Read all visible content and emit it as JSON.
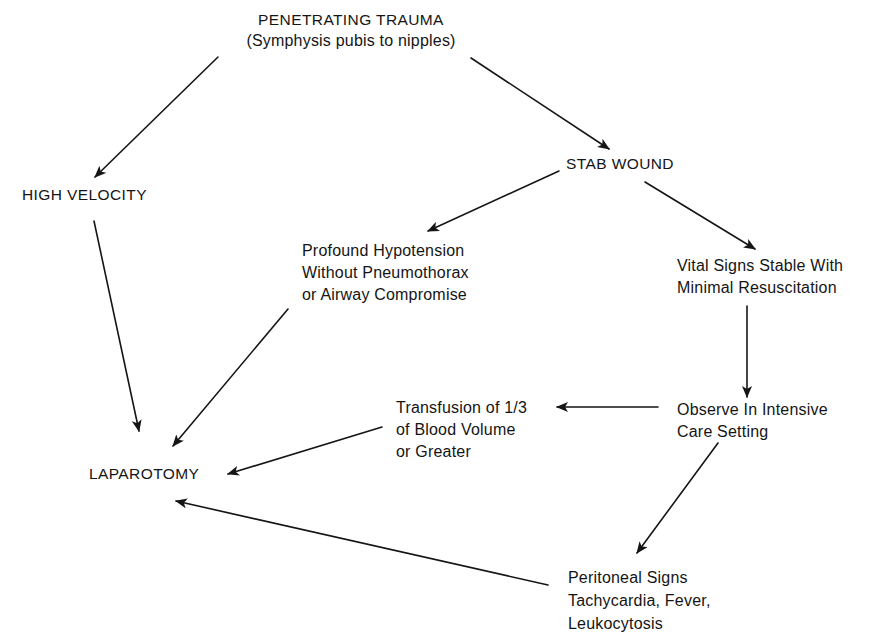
{
  "diagram": {
    "type": "flowchart",
    "colors": {
      "background": "#ffffff",
      "ink": "#151515"
    },
    "nodes": {
      "penetrating_trauma": {
        "lines": [
          "PENETRATING TRAUMA",
          "(Symphysis pubis to nipples)"
        ]
      },
      "high_velocity": {
        "lines": [
          "HIGH VELOCITY"
        ]
      },
      "stab_wound": {
        "lines": [
          "STAB WOUND"
        ]
      },
      "profound_hypotension": {
        "lines": [
          "Profound Hypotension",
          "Without Pneumothorax",
          "or Airway Compromise"
        ]
      },
      "vital_signs_stable": {
        "lines": [
          "Vital Signs Stable With",
          "Minimal Resuscitation"
        ]
      },
      "transfusion": {
        "lines": [
          "Transfusion of 1/3",
          "of Blood Volume",
          "or Greater"
        ]
      },
      "observe_icu": {
        "lines": [
          "Observe In Intensive",
          "Care Setting"
        ]
      },
      "laparotomy": {
        "lines": [
          "LAPAROTOMY"
        ]
      },
      "peritoneal_signs": {
        "lines": [
          "Peritoneal Signs",
          "Tachycardia, Fever,",
          "Leukocytosis"
        ]
      }
    },
    "edges": [
      {
        "from": "penetrating_trauma",
        "to": "high_velocity"
      },
      {
        "from": "penetrating_trauma",
        "to": "stab_wound"
      },
      {
        "from": "stab_wound",
        "to": "profound_hypotension"
      },
      {
        "from": "stab_wound",
        "to": "vital_signs_stable"
      },
      {
        "from": "high_velocity",
        "to": "laparotomy"
      },
      {
        "from": "profound_hypotension",
        "to": "laparotomy"
      },
      {
        "from": "vital_signs_stable",
        "to": "observe_icu"
      },
      {
        "from": "observe_icu",
        "to": "transfusion"
      },
      {
        "from": "transfusion",
        "to": "laparotomy"
      },
      {
        "from": "observe_icu",
        "to": "peritoneal_signs"
      },
      {
        "from": "peritoneal_signs",
        "to": "laparotomy"
      }
    ]
  }
}
